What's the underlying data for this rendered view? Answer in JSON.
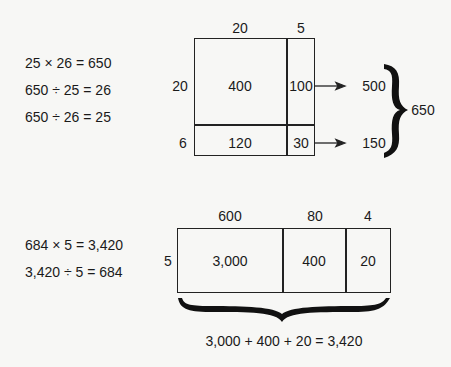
{
  "top_example": {
    "equations": [
      "25 × 26 = 650",
      "650 ÷ 25 = 26",
      "650 ÷ 26 = 25"
    ],
    "area_model": {
      "column_headers": [
        "20",
        "5"
      ],
      "row_headers": [
        "20",
        "6"
      ],
      "cells": [
        [
          "400",
          "100"
        ],
        [
          "120",
          "30"
        ]
      ],
      "row_totals": [
        "500",
        "150"
      ],
      "grand_total": "650"
    }
  },
  "bottom_example": {
    "equations": [
      "684 × 5 = 3,420",
      "3,420 ÷ 5 = 684"
    ],
    "area_model": {
      "column_headers": [
        "600",
        "80",
        "4"
      ],
      "row_headers": [
        "5"
      ],
      "cells": [
        [
          "3,000",
          "400",
          "20"
        ]
      ],
      "sum_equation": "3,000 + 400 + 20 = 3,420"
    }
  }
}
